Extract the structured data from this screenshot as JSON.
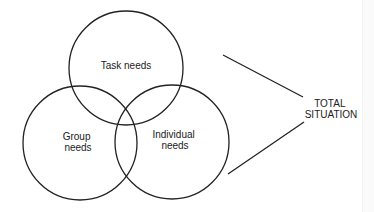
{
  "diagram": {
    "type": "venn",
    "circles": [
      {
        "id": "task",
        "label_lines": [
          "Task needs"
        ],
        "cx": 126,
        "cy": 68,
        "r": 57
      },
      {
        "id": "group",
        "label_lines": [
          "Group",
          "needs"
        ],
        "cx": 80,
        "cy": 143,
        "r": 57
      },
      {
        "id": "individual",
        "label_lines": [
          "Individual",
          "needs"
        ],
        "cx": 172,
        "cy": 142,
        "r": 57
      }
    ],
    "connector_lines": [
      {
        "x1": 223,
        "y1": 55,
        "x2": 303,
        "y2": 97
      },
      {
        "x1": 228,
        "y1": 174,
        "x2": 304,
        "y2": 122
      }
    ],
    "outcome_label_lines": [
      "TOTAL",
      "SITUATION"
    ],
    "stroke_color": "#222222",
    "text_color": "#222222"
  }
}
